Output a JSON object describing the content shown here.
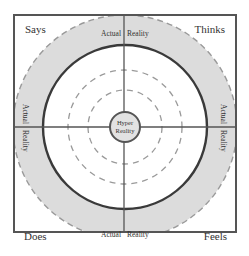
{
  "diagram": {
    "type": "empathy-map-concentric",
    "quadrants": {
      "top_left": "Says",
      "top_right": "Thinks",
      "bottom_left": "Does",
      "bottom_right": "Feels"
    },
    "ring_labels": {
      "top": [
        "Actual",
        "Reality"
      ],
      "bottom": [
        "Actual",
        "Reality"
      ],
      "left": [
        "Actual",
        "Reality"
      ],
      "right": [
        "Actual",
        "Reality"
      ]
    },
    "center": {
      "line1": "Hyper",
      "line2": "Reality"
    },
    "colors": {
      "frame": "#555555",
      "band": "#dcdcdc",
      "dashed": "#999999",
      "solid_ring": "#3a3a3a",
      "text": "#333333"
    }
  }
}
